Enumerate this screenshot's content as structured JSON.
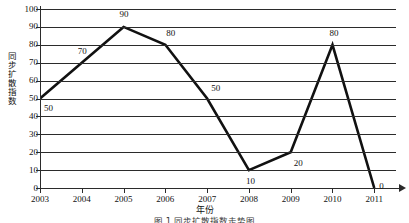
{
  "chart_data": {
    "type": "line",
    "title": "",
    "xlabel": "年份",
    "ylabel": "同步扩散指数",
    "categories": [
      "2003",
      "2004",
      "2005",
      "2006",
      "2007",
      "2008",
      "2009",
      "2010",
      "2011"
    ],
    "values": [
      50,
      70,
      90,
      80,
      50,
      10,
      20,
      80,
      0
    ],
    "point_labels": [
      "50",
      "70",
      "90",
      "80",
      "50",
      "10",
      "20",
      "80",
      "0"
    ],
    "ylim": [
      0,
      100
    ],
    "yticks": [
      "0",
      "10",
      "20",
      "30",
      "40",
      "50",
      "60",
      "70",
      "80",
      "90",
      "100"
    ],
    "grid": "horizontal",
    "legend": "none",
    "series": [
      {
        "name": "同步扩散指数",
        "values": [
          50,
          70,
          90,
          80,
          50,
          10,
          20,
          80,
          0
        ]
      }
    ],
    "line_color": "#111111",
    "grid_color": "#2b2b2b",
    "axis_color": "#2b2b2b"
  },
  "axes": {
    "y_title": "同步扩散指数",
    "x_title": "年份"
  },
  "caption": "图 1   同步扩散指数走势图",
  "colors": {
    "line": "#111111",
    "grid": "#2b2b2b",
    "background": "#ffffff"
  }
}
